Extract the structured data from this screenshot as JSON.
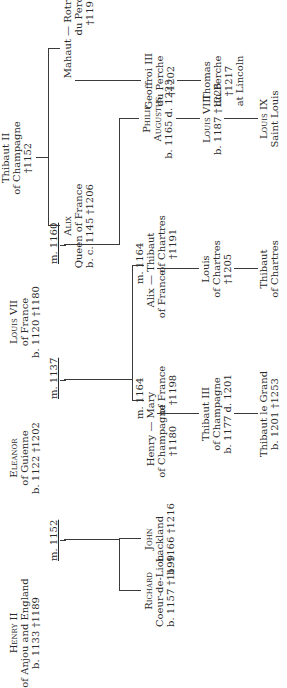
{
  "diagram": {
    "type": "genealogy-tree",
    "orientation": "rotated-90-ccw",
    "people": {
      "henry2": {
        "name": "Henry II",
        "line2": "of Anjou and England",
        "line3": "b. 1133 †1189"
      },
      "eleanor": {
        "name": "Eleanor",
        "line2": "of Guienne",
        "line3": "b. 1122 †1202"
      },
      "louis7": {
        "name": "Louis VII",
        "line2": "of France",
        "line3": "b. 1120 †1180"
      },
      "thibaut2": {
        "name": "Thibaut II",
        "line2": "of Champagne",
        "line3": "†1152"
      },
      "richard": {
        "name": "Richard",
        "line2": "Coeur-de-Lion",
        "line3": "b. 1157 †1199"
      },
      "john": {
        "name": "John",
        "line2": "Lackland",
        "line3": "b. 1166 †1216"
      },
      "henry_champ": {
        "name": "Henry",
        "line2": "of Champagne",
        "line3": "†1180"
      },
      "mary": {
        "name": "Mary",
        "line2": "of France",
        "line3": "†1198"
      },
      "alix_fr": {
        "name": "Alix",
        "line2": "of France"
      },
      "thibaut_chartres": {
        "name": "Thibaut",
        "line2": "of Chartres",
        "line3": "†1191"
      },
      "philip": {
        "name": "Philip",
        "line2": "Augustus",
        "line3": "b. 1165 d. 1223"
      },
      "alix_queen": {
        "name": "Alix",
        "line2": "Queen of France",
        "line3": "b. c. 1145 †1206"
      },
      "mahaut": {
        "name": "Mahaut"
      },
      "rotrou": {
        "name": "Rotrou",
        "line2": "du Perche",
        "line3": "†1191"
      },
      "thibaut3": {
        "name": "Thibaut III",
        "line2": "of Champagne",
        "line3": "b. 1177 d. 1201"
      },
      "louis_chartres": {
        "name": "Louis",
        "line2": "of Chartres",
        "line3": "†1205"
      },
      "louis8": {
        "name": "Louis VIII",
        "line2": "b. 1187 †1226"
      },
      "geoffroi3": {
        "name": "Geoffroi III",
        "line2": "du Perche",
        "line3": "†1202"
      },
      "thibaut_grand": {
        "name": "Thibaut le Grand",
        "line2": "b. 1201 †1253"
      },
      "thibaut_ch2": {
        "name": "Thibaut",
        "line2": "of Chartres"
      },
      "louis9": {
        "name": "Louis IX",
        "line2": "Saint Louis"
      },
      "thomas": {
        "name": "Thomas",
        "line2": "du Perche",
        "line3": "†1217",
        "line4": "at Lincoln"
      }
    },
    "marriages": {
      "m1152": "m. 1152",
      "m1137": "m. 1137",
      "m1160": "m. 1160",
      "m1164a": "m. 1164",
      "m1164b": "m. 1164",
      "dash": "—"
    }
  }
}
